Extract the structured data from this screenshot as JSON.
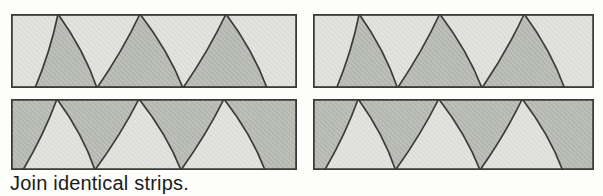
{
  "figure": {
    "caption": "Join identical strips."
  },
  "colors": {
    "page_background": "#fdfdfb",
    "light_fill": "#e3e3df",
    "light_hatch": "#dadad4",
    "dark_fill": "#bec0ba",
    "dark_hatch": "#adafa9",
    "outline": "#3b3b39",
    "caption_text": "#1b1b1b"
  },
  "strips": [
    {
      "id": "top-left",
      "background": "light",
      "arches": "dark"
    },
    {
      "id": "top-right",
      "background": "light",
      "arches": "dark"
    },
    {
      "id": "bottom-left",
      "background": "dark",
      "arches": "light"
    },
    {
      "id": "bottom-right",
      "background": "dark",
      "arches": "light"
    }
  ]
}
